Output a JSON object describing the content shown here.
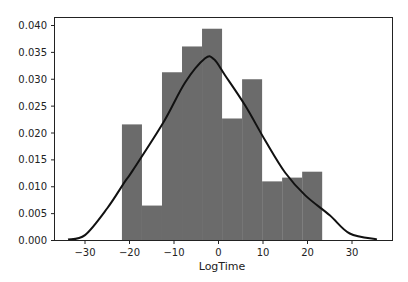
{
  "chart_data": {
    "type": "bar",
    "subtype": "histogram_with_kde",
    "title": "",
    "xlabel": "LogTime",
    "ylabel": "",
    "xlim": [
      -37,
      39
    ],
    "ylim": [
      0,
      0.0402
    ],
    "grid": false,
    "legend": null,
    "x_ticks": [
      -30,
      -20,
      -10,
      0,
      10,
      20,
      30
    ],
    "x_tick_labels": [
      "−30",
      "−20",
      "−10",
      "0",
      "10",
      "20",
      "30"
    ],
    "y_ticks": [
      0.0,
      0.005,
      0.01,
      0.015,
      0.02,
      0.025,
      0.03,
      0.035,
      0.04
    ],
    "y_tick_labels": [
      "0.000",
      "0.005",
      "0.010",
      "0.015",
      "0.020",
      "0.025",
      "0.030",
      "0.035",
      "0.040"
    ],
    "bin_edges": [
      -21.7,
      -17.2,
      -12.7,
      -8.2,
      -3.7,
      0.8,
      5.3,
      9.8,
      14.3,
      18.8,
      23.3
    ],
    "values": [
      0.0216,
      0.0065,
      0.0313,
      0.0361,
      0.0394,
      0.0227,
      0.03,
      0.011,
      0.0117,
      0.0128
    ],
    "kde": {
      "x": [
        -33.8,
        -30,
        -25,
        -21,
        -19.3,
        -12.5,
        -7.5,
        -3,
        -1,
        1.5,
        6,
        10.5,
        15,
        19.5,
        25,
        29.5,
        35.6
      ],
      "y": [
        0.0002,
        0.001,
        0.006,
        0.011,
        0.013,
        0.0218,
        0.0294,
        0.0339,
        0.0337,
        0.0307,
        0.0251,
        0.0186,
        0.0126,
        0.0084,
        0.0047,
        0.0013,
        0.0002
      ]
    },
    "colors": {
      "bars": "#6b6b6b",
      "kde": "#111111",
      "axes": "#222222"
    }
  }
}
